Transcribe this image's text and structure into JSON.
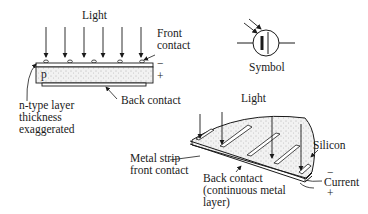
{
  "colors": {
    "ink": "#1a1a1a",
    "fill": "#e6e6e6",
    "background": "#ffffff"
  },
  "flat_cell": {
    "light_label": "Light",
    "front_contact_label": "Front\ncontact",
    "minus_sign": "−",
    "plus_sign": "+",
    "p_label": "p",
    "back_contact_label": "Back contact",
    "n_layer_label": "n-type layer\nthickness\nexaggerated",
    "arrow_count": 6
  },
  "symbol": {
    "label": "Symbol",
    "icon": "photovoltaic-cell-symbol-icon"
  },
  "round_cell": {
    "light_label": "Light",
    "silicon_label": "Silicon",
    "metal_strip_label": "Metal strip\nfront contact",
    "back_contact_label": "Back contact\n(continuous metal\nlayer)",
    "current_label": "Current",
    "minus_sign": "−",
    "plus_sign": "+"
  }
}
